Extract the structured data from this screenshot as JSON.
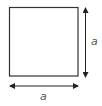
{
  "diagram": {
    "shape": "square",
    "side_label": "a",
    "labels": {
      "right": "a",
      "bottom": "a"
    },
    "arrows": [
      {
        "name": "vertical-dimension-arrow",
        "direction": "double",
        "label": "a"
      },
      {
        "name": "horizontal-dimension-arrow",
        "direction": "double",
        "label": "a"
      }
    ],
    "colors": {
      "stroke": "#333333",
      "arrow": "#222222",
      "label": "#555555",
      "background": "#ffffff"
    }
  }
}
